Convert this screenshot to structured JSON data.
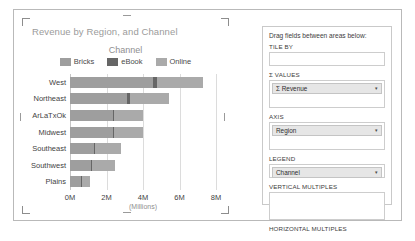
{
  "chart_data": {
    "type": "bar",
    "orientation": "horizontal",
    "stacked": true,
    "title": "Revenue by Region, and Channel",
    "xlabel": "(Millions)",
    "ylabel": "",
    "legend_title": "Channel",
    "legend_position": "top",
    "grid": true,
    "xlim": [
      0,
      8
    ],
    "xticks": [
      "0M",
      "2M",
      "4M",
      "6M",
      "8M"
    ],
    "xtick_values": [
      0,
      2,
      4,
      6,
      8
    ],
    "categories": [
      "West",
      "Northeast",
      "ArLaTxOk",
      "Midwest",
      "Southeast",
      "Southwest",
      "Plains"
    ],
    "series": [
      {
        "name": "Bricks",
        "color": "#9e9e9e",
        "values": [
          4.55,
          3.15,
          2.35,
          2.35,
          1.3,
          1.15,
          0.6
        ]
      },
      {
        "name": "eBook",
        "color": "#666666",
        "values": [
          0.2,
          0.15,
          0.05,
          0.05,
          0.05,
          0.05,
          0.05
        ]
      },
      {
        "name": "Online",
        "color": "#aaaaaa",
        "values": [
          2.55,
          2.1,
          1.6,
          1.6,
          1.45,
          1.25,
          0.45
        ]
      }
    ],
    "totals": [
      7.3,
      5.4,
      4.0,
      4.0,
      2.8,
      2.45,
      1.1
    ]
  },
  "chart": {
    "title": "Revenue by Region, and Channel",
    "legend_title": "Channel",
    "axis_title": "(Millions)"
  },
  "field_panel": {
    "hint": "Drag fields between areas below:",
    "zones": [
      {
        "label": "TILE BY",
        "value": "",
        "has_value": false
      },
      {
        "label": "Σ VALUES",
        "value": "Σ Revenue",
        "has_value": true
      },
      {
        "label": "AXIS",
        "value": "Region",
        "has_value": true
      },
      {
        "label": "LEGEND",
        "value": "Channel",
        "has_value": true
      },
      {
        "label": "VERTICAL MULTIPLES",
        "value": "",
        "has_value": false
      },
      {
        "label": "HORIZONTAL MULTIPLES",
        "value": "",
        "has_value": false
      }
    ],
    "caret_icon": "▾"
  }
}
